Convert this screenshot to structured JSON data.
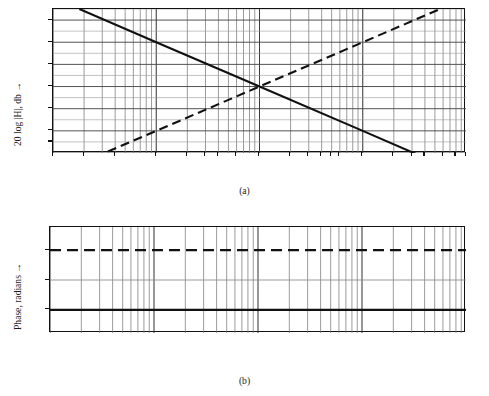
{
  "figure": {
    "type": "bode-plot-pair",
    "background": "#ffffff",
    "ink": "#111111",
    "grid_color": "#808080"
  },
  "panel_a": {
    "caption": "(a)",
    "y_axis": {
      "title": "20 log |H|, db",
      "title_arrow": "→",
      "ticks": [
        {
          "value": 30,
          "label": "30"
        },
        {
          "value": 20,
          "label": "20"
        },
        {
          "value": 10,
          "label": "10"
        },
        {
          "value": 0,
          "label": "0"
        },
        {
          "value": -10,
          "label": "– 10"
        },
        {
          "value": -20,
          "label": "– 20"
        },
        {
          "value": -25,
          "label": "– 25"
        }
      ],
      "min": -30,
      "max": 35
    },
    "x_axis": {
      "scale": "log10",
      "min": 0.01,
      "max": 100,
      "ticks": [
        {
          "value": 0.01,
          "label": "0.01"
        },
        {
          "value": 0.02,
          "label": "0.02"
        },
        {
          "value": 0.04,
          "label": "0.04"
        },
        {
          "value": 0.1,
          "label": "0.1"
        },
        {
          "value": 0.2,
          "label": ".2"
        },
        {
          "value": 0.3,
          "label": ".3"
        },
        {
          "value": 0.4,
          "label": ".4"
        },
        {
          "value": 0.6,
          "label": ".6"
        },
        {
          "value": 1,
          "label": "ω = 1"
        },
        {
          "value": 2,
          "label": "2"
        },
        {
          "value": 3,
          "label": "3"
        },
        {
          "value": 4,
          "label": "4"
        },
        {
          "value": 5,
          "label": "5"
        },
        {
          "value": 6,
          "label": "6"
        },
        {
          "value": 10,
          "label": "10"
        },
        {
          "value": 20,
          "label": "20"
        },
        {
          "value": 30,
          "label": "30"
        },
        {
          "value": 40,
          "label": "40"
        },
        {
          "value": 60,
          "label": "60"
        },
        {
          "value": 80,
          "label": "80"
        },
        {
          "value": 100,
          "label": "100"
        }
      ],
      "u_labels": [
        {
          "at": 0.01,
          "label": "(u = – 2)"
        },
        {
          "at": 0.1,
          "label": "(u = – 1)"
        },
        {
          "at": 1,
          "label": "(u = 0)"
        },
        {
          "at": 10,
          "label": "(u = 1)"
        },
        {
          "at": 100,
          "label": "(u = 2)"
        }
      ]
    }
  },
  "panel_b": {
    "caption": "(b)",
    "y_axis": {
      "title": "Phase, radians",
      "title_arrow": "→",
      "ticks": [
        {
          "value": 90,
          "label": "90°"
        },
        {
          "value": 0,
          "label": "0"
        },
        {
          "value": -90,
          "label": "– 90°"
        }
      ],
      "min": -160,
      "max": 160
    },
    "x_axis": {
      "scale": "log10",
      "min": 0.01,
      "max": 100,
      "ticks": [
        {
          "value": 0.01,
          "label": "0.01"
        },
        {
          "value": 0.1,
          "label": "0.1"
        },
        {
          "value": 1,
          "label": "ω = 1"
        },
        {
          "value": 10,
          "label": "10"
        },
        {
          "value": 100,
          "label": "100"
        }
      ],
      "u_labels": [
        {
          "at": 0.01,
          "label": "(u = – 2)"
        },
        {
          "at": 0.1,
          "label": "(u = – 1)"
        },
        {
          "at": 1,
          "label": "(u = 0)"
        },
        {
          "at": 10,
          "label": "(u = 1)"
        },
        {
          "at": 100,
          "label": "u = 2"
        }
      ]
    }
  },
  "chart_data": [
    {
      "type": "line",
      "title": "(a) Magnitude asymptotes",
      "xlabel": "ω",
      "ylabel": "20 log |H|, db",
      "xscale": "log",
      "xlim": [
        0.01,
        100
      ],
      "ylim": [
        -30,
        35
      ],
      "grid": true,
      "legend": "none",
      "series": [
        {
          "name": "integrator (–6 db/octave, –20 db/decade)",
          "style": "solid",
          "slope_db_per_decade": -20,
          "x": [
            0.018,
            0.1,
            1,
            10,
            35
          ],
          "y": [
            35,
            20,
            0,
            -20,
            -31
          ]
        },
        {
          "name": "differentiator (+6 db/octave, +20 db/decade)",
          "style": "dashed",
          "slope_db_per_decade": 20,
          "x": [
            0.034,
            0.1,
            1,
            10,
            55
          ],
          "y": [
            -29.3,
            -20,
            0,
            20,
            34.8
          ]
        }
      ]
    },
    {
      "type": "line",
      "title": "(b) Phase",
      "xlabel": "ω",
      "ylabel": "Phase, radians",
      "xscale": "log",
      "xlim": [
        0.01,
        100
      ],
      "ylim": [
        -160,
        160
      ],
      "grid": true,
      "legend": "none",
      "series": [
        {
          "name": "differentiator phase +90°",
          "style": "dashed",
          "x": [
            0.01,
            100
          ],
          "y": [
            90,
            90
          ]
        },
        {
          "name": "integrator phase –90°",
          "style": "solid",
          "x": [
            0.01,
            100
          ],
          "y": [
            -90,
            -90
          ]
        }
      ]
    }
  ]
}
